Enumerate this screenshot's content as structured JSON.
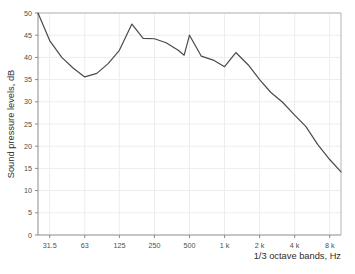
{
  "chart_data": {
    "type": "line",
    "title": "",
    "xlabel": "1/3 octave bands, Hz",
    "ylabel": "Sound pressure levels, dB",
    "ylim": [
      0,
      50
    ],
    "ytick_step": 5,
    "ytick_labels": [
      "0",
      "5",
      "10",
      "15",
      "20",
      "25",
      "30",
      "35",
      "40",
      "45",
      "50"
    ],
    "xtick_labels": [
      "31.5",
      "63",
      "125",
      "250",
      "500",
      "1 k",
      "2 k",
      "4 k",
      "8 k"
    ],
    "grid": true,
    "legend": "none",
    "line_color": "#4a4a4a",
    "grid_color": "#ededed",
    "axis_color": "#8c8c8c",
    "background": "#ffffff",
    "x_bands_hz": [
      25,
      31.5,
      40,
      50,
      63,
      80,
      100,
      125,
      160,
      200,
      250,
      315,
      400,
      500,
      630,
      800,
      1000,
      1250,
      1600,
      2000,
      2500,
      3150,
      4000,
      5000,
      6300,
      8000,
      10000
    ],
    "values": [
      50.0,
      43.8,
      40.0,
      37.6,
      35.6,
      35.8,
      36.4,
      41.6,
      47.5,
      44.3,
      44.2,
      43.3,
      42.0,
      40.5,
      45.0,
      41.1,
      40.3,
      39.2,
      38.0,
      37.8,
      41.1,
      38.8,
      36.2,
      33.6,
      31.7,
      28.6,
      25.4,
      22.1,
      18.3,
      14.2
    ],
    "points": [
      {
        "hz": 25,
        "db": 50.0
      },
      {
        "hz": 31.5,
        "db": 43.8
      },
      {
        "hz": 40,
        "db": 40.0
      },
      {
        "hz": 50,
        "db": 37.6
      },
      {
        "hz": 63,
        "db": 35.6
      },
      {
        "hz": 80,
        "db": 36.4
      },
      {
        "hz": 100,
        "db": 38.6
      },
      {
        "hz": 125,
        "db": 41.6
      },
      {
        "hz": 160,
        "db": 47.5
      },
      {
        "hz": 200,
        "db": 44.3
      },
      {
        "hz": 250,
        "db": 44.2
      },
      {
        "hz": 315,
        "db": 43.3
      },
      {
        "hz": 400,
        "db": 41.6
      },
      {
        "hz": 450,
        "db": 40.5
      },
      {
        "hz": 500,
        "db": 45.0
      },
      {
        "hz": 630,
        "db": 40.3
      },
      {
        "hz": 800,
        "db": 39.4
      },
      {
        "hz": 1000,
        "db": 37.9
      },
      {
        "hz": 1250,
        "db": 41.1
      },
      {
        "hz": 1600,
        "db": 38.3
      },
      {
        "hz": 2000,
        "db": 35.0
      },
      {
        "hz": 2500,
        "db": 32.1
      },
      {
        "hz": 3150,
        "db": 29.9
      },
      {
        "hz": 4000,
        "db": 27.0
      },
      {
        "hz": 5000,
        "db": 24.4
      },
      {
        "hz": 6300,
        "db": 20.4
      },
      {
        "hz": 8000,
        "db": 17.0
      },
      {
        "hz": 10000,
        "db": 14.2
      }
    ]
  },
  "axes": {
    "y_title": "Sound pressure levels, dB",
    "x_title": "1/3 octave bands, Hz"
  }
}
